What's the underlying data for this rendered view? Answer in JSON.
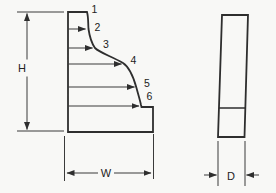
{
  "figure": {
    "type": "technical-diagram",
    "front_view": {
      "description": "profile with curved face",
      "point_labels": [
        "1",
        "2",
        "3",
        "4",
        "5",
        "6"
      ],
      "height_label": "H",
      "width_label": "W"
    },
    "side_view": {
      "description": "narrow slab with base segment",
      "depth_label": "D"
    },
    "colors": {
      "line": "#2e2e2e",
      "thin_line": "#3a3a3a",
      "label": "#222222",
      "background": "#f8f8f6"
    }
  }
}
